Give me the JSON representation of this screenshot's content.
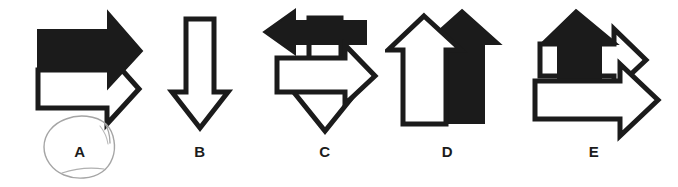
{
  "page": {
    "background_color": "#ffffff",
    "ink_color": "#1b1b1b",
    "fill_white": "#ffffff",
    "annotation_color": "#9a9a9a",
    "width": 678,
    "height": 187
  },
  "figures": [
    {
      "id": "A",
      "label": "A",
      "description": "Two right-pointing arrows stacked: solid black arrow above, white outlined arrow below",
      "arrow_count": 2,
      "arrows": [
        {
          "name": "black-right-arrow",
          "direction": "right",
          "fill": "black"
        },
        {
          "name": "white-right-arrow",
          "direction": "right",
          "fill": "white"
        }
      ],
      "annotated": true,
      "annotation": "hand-drawn pencil circle around label A"
    },
    {
      "id": "B",
      "label": "B",
      "description": "A single white outlined arrow pointing down",
      "arrow_count": 1,
      "arrows": [
        {
          "name": "white-down-arrow",
          "direction": "down",
          "fill": "white"
        }
      ],
      "annotated": false,
      "annotation": ""
    },
    {
      "id": "C",
      "label": "C",
      "description": "Three arrows: solid black arrow pointing left, white outlined arrow pointing right, white outlined arrow pointing down",
      "arrow_count": 3,
      "arrows": [
        {
          "name": "white-down-arrow",
          "direction": "down",
          "fill": "white"
        },
        {
          "name": "black-left-arrow",
          "direction": "left",
          "fill": "black"
        },
        {
          "name": "white-right-arrow",
          "direction": "right",
          "fill": "white"
        }
      ],
      "annotated": false,
      "annotation": ""
    },
    {
      "id": "D",
      "label": "D",
      "description": "Two up-pointing arrows side by side: white outlined arrow on left, solid black arrow on right",
      "arrow_count": 2,
      "arrows": [
        {
          "name": "black-up-arrow",
          "direction": "up",
          "fill": "black"
        },
        {
          "name": "white-up-arrow",
          "direction": "up",
          "fill": "white"
        }
      ],
      "annotated": false,
      "annotation": ""
    },
    {
      "id": "E",
      "label": "E",
      "description": "Three arrows: solid black arrow pointing up overlapping two white outlined arrows pointing right",
      "arrow_count": 3,
      "arrows": [
        {
          "name": "white-right-arrow-upper",
          "direction": "right",
          "fill": "white"
        },
        {
          "name": "black-up-arrow",
          "direction": "up",
          "fill": "black"
        },
        {
          "name": "white-right-arrow-lower",
          "direction": "right",
          "fill": "white"
        }
      ],
      "annotated": false,
      "annotation": ""
    }
  ]
}
